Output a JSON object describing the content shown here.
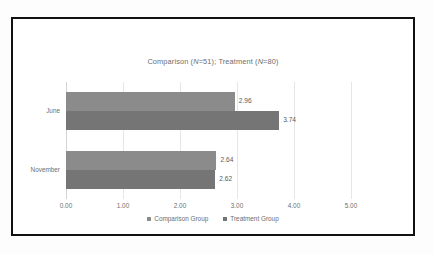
{
  "figure": {
    "border_color": "#111111",
    "background": "#ffffff"
  },
  "chart_data": {
    "type": "bar",
    "orientation": "horizontal",
    "title": "Comparison (N=51); Treatment (N=80)",
    "title_parts": {
      "a": "Comparison (",
      "n1": "N",
      "b": "=51); Treatment (",
      "n2": "N",
      "c": "=80)"
    },
    "categories": [
      "June",
      "November"
    ],
    "series": [
      {
        "name": "Comparison Group",
        "values": [
          2.96,
          2.64
        ],
        "color": "#8b8b8b"
      },
      {
        "name": "Treatment Group",
        "values": [
          3.74,
          2.62
        ],
        "color": "#757575"
      }
    ],
    "data_labels": [
      [
        "2.96",
        "3.74"
      ],
      [
        "2.64",
        "2.62"
      ]
    ],
    "xlabel": "",
    "ylabel": "",
    "xlim": [
      0,
      5
    ],
    "xticks": [
      "0.00",
      "1.00",
      "2.00",
      "3.00",
      "4.00",
      "5.00"
    ],
    "xtick_values": [
      0,
      1,
      2,
      3,
      4,
      5
    ],
    "grid": true,
    "grid_color": "#e6e6e6",
    "legend_position": "bottom",
    "text_color": "#6e6e6e"
  }
}
